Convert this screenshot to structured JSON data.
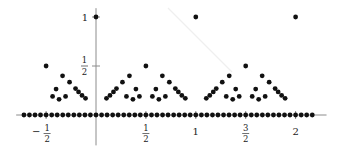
{
  "chart_data": {
    "type": "scatter",
    "title": "",
    "xlabel": "",
    "ylabel": "",
    "xlim": [
      -0.8,
      2.31
    ],
    "ylim": [
      -0.31,
      1.09
    ],
    "grid": false,
    "legend": null,
    "x_ticks": [
      {
        "value": -0.5,
        "sign": "−",
        "numerator": "1",
        "denominator": "2"
      },
      {
        "value": 0.5,
        "sign": "",
        "numerator": "1",
        "denominator": "2"
      },
      {
        "value": 1,
        "text": "1"
      },
      {
        "value": 1.5,
        "sign": "",
        "numerator": "3",
        "denominator": "2"
      },
      {
        "value": 2,
        "text": "2"
      }
    ],
    "y_ticks": [
      {
        "value": 0.5,
        "numerator": "1",
        "denominator": "2"
      },
      {
        "value": 1,
        "text": "1"
      }
    ],
    "series": [
      {
        "name": "points above axis",
        "points": [
          [
            -0.5,
            0.5
          ],
          [
            0,
            1
          ],
          [
            0.5,
            0.5
          ],
          [
            1,
            1
          ],
          [
            1.5,
            0.5
          ],
          [
            2,
            1
          ],
          [
            -0.105,
            0.17
          ],
          [
            -0.14,
            0.2
          ],
          [
            -0.175,
            0.235
          ],
          [
            -0.205,
            0.27
          ],
          [
            -0.265,
            0.335
          ],
          [
            -0.335,
            0.4
          ],
          [
            -0.305,
            0.19
          ],
          [
            -0.37,
            0.16
          ],
          [
            -0.4,
            0.265
          ],
          [
            -0.435,
            0.19
          ],
          [
            0.105,
            0.17
          ],
          [
            0.14,
            0.2
          ],
          [
            0.175,
            0.235
          ],
          [
            0.205,
            0.27
          ],
          [
            0.265,
            0.335
          ],
          [
            0.335,
            0.4
          ],
          [
            0.305,
            0.19
          ],
          [
            0.37,
            0.16
          ],
          [
            0.4,
            0.265
          ],
          [
            0.435,
            0.19
          ],
          [
            0.895,
            0.17
          ],
          [
            0.86,
            0.2
          ],
          [
            0.825,
            0.235
          ],
          [
            0.795,
            0.27
          ],
          [
            0.735,
            0.335
          ],
          [
            0.665,
            0.4
          ],
          [
            0.695,
            0.19
          ],
          [
            0.63,
            0.16
          ],
          [
            0.6,
            0.265
          ],
          [
            0.565,
            0.19
          ],
          [
            1.105,
            0.17
          ],
          [
            1.14,
            0.2
          ],
          [
            1.175,
            0.235
          ],
          [
            1.205,
            0.27
          ],
          [
            1.265,
            0.335
          ],
          [
            1.335,
            0.4
          ],
          [
            1.305,
            0.19
          ],
          [
            1.37,
            0.16
          ],
          [
            1.4,
            0.265
          ],
          [
            1.435,
            0.19
          ],
          [
            1.895,
            0.17
          ],
          [
            1.86,
            0.2
          ],
          [
            1.825,
            0.235
          ],
          [
            1.795,
            0.27
          ],
          [
            1.735,
            0.335
          ],
          [
            1.665,
            0.4
          ],
          [
            1.695,
            0.19
          ],
          [
            1.63,
            0.16
          ],
          [
            1.6,
            0.265
          ],
          [
            1.565,
            0.19
          ]
        ]
      },
      {
        "name": "points on axis",
        "points": [
          [
            -0.722,
            0
          ],
          [
            -0.667,
            0
          ],
          [
            -0.611,
            0
          ],
          [
            -0.556,
            0
          ],
          [
            -0.5,
            0
          ],
          [
            -0.444,
            0
          ],
          [
            -0.389,
            0
          ],
          [
            -0.333,
            0
          ],
          [
            -0.278,
            0
          ],
          [
            -0.222,
            0
          ],
          [
            -0.167,
            0
          ],
          [
            -0.111,
            0
          ],
          [
            -0.056,
            0
          ],
          [
            0,
            0
          ],
          [
            0.056,
            0
          ],
          [
            0.111,
            0
          ],
          [
            0.167,
            0
          ],
          [
            0.222,
            0
          ],
          [
            0.278,
            0
          ],
          [
            0.333,
            0
          ],
          [
            0.389,
            0
          ],
          [
            0.444,
            0
          ],
          [
            0.5,
            0
          ],
          [
            0.556,
            0
          ],
          [
            0.611,
            0
          ],
          [
            0.667,
            0
          ],
          [
            0.722,
            0
          ],
          [
            0.778,
            0
          ],
          [
            0.833,
            0
          ],
          [
            0.889,
            0
          ],
          [
            0.944,
            0
          ],
          [
            1,
            0
          ],
          [
            1.056,
            0
          ],
          [
            1.111,
            0
          ],
          [
            1.167,
            0
          ],
          [
            1.222,
            0
          ],
          [
            1.278,
            0
          ],
          [
            1.333,
            0
          ],
          [
            1.389,
            0
          ],
          [
            1.444,
            0
          ],
          [
            1.5,
            0
          ],
          [
            1.556,
            0
          ],
          [
            1.611,
            0
          ],
          [
            1.667,
            0
          ],
          [
            1.722,
            0
          ],
          [
            1.778,
            0
          ],
          [
            1.833,
            0
          ],
          [
            1.889,
            0
          ],
          [
            1.944,
            0
          ],
          [
            2,
            0
          ],
          [
            2.056,
            0
          ],
          [
            2.111,
            0
          ],
          [
            2.167,
            0
          ]
        ]
      }
    ]
  }
}
